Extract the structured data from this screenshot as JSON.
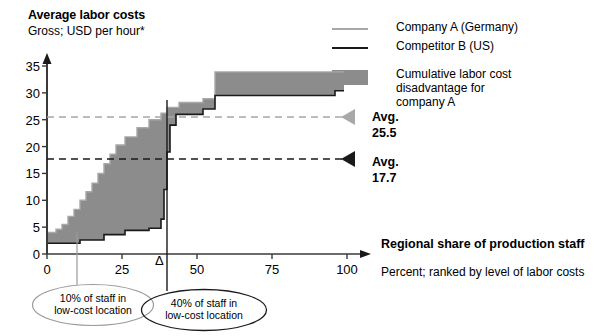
{
  "chart_data": {
    "type": "area",
    "title": "Average labor costs",
    "subtitle": "Gross; USD per hour*",
    "xlabel": "Regional share of production staff",
    "xsublabel": "Percent; ranked by level of labor costs",
    "ylabel": "",
    "xlim": [
      0,
      100
    ],
    "ylim": [
      0,
      35
    ],
    "xticks": [
      0,
      25,
      50,
      75,
      100
    ],
    "yticks": [
      0,
      5,
      10,
      15,
      20,
      25,
      30,
      35
    ],
    "grid": false,
    "legend_position": "top-right",
    "series": [
      {
        "name": "Company A (Germany)",
        "color": "#a8a8a8",
        "style": "step",
        "points": [
          [
            0,
            4.0
          ],
          [
            3,
            4.0
          ],
          [
            3,
            4.6
          ],
          [
            5,
            4.6
          ],
          [
            5,
            5.5
          ],
          [
            7,
            5.5
          ],
          [
            7,
            7.0
          ],
          [
            9,
            7.0
          ],
          [
            9,
            8.3
          ],
          [
            11,
            8.3
          ],
          [
            11,
            10.0
          ],
          [
            13,
            10.0
          ],
          [
            13,
            11.6
          ],
          [
            15,
            11.6
          ],
          [
            15,
            13.2
          ],
          [
            17,
            13.2
          ],
          [
            17,
            15.0
          ],
          [
            19,
            15.0
          ],
          [
            19,
            16.8
          ],
          [
            21,
            16.8
          ],
          [
            21,
            18.6
          ],
          [
            23,
            18.6
          ],
          [
            23,
            20.3
          ],
          [
            26,
            20.3
          ],
          [
            26,
            21.8
          ],
          [
            30,
            21.8
          ],
          [
            30,
            23.5
          ],
          [
            34,
            23.5
          ],
          [
            34,
            25.0
          ],
          [
            38,
            25.0
          ],
          [
            38,
            26.2
          ],
          [
            40,
            26.2
          ],
          [
            40,
            27.3
          ],
          [
            44,
            27.3
          ],
          [
            44,
            28.2
          ],
          [
            52,
            28.2
          ],
          [
            52,
            28.9
          ],
          [
            56,
            28.9
          ],
          [
            56,
            33.9
          ],
          [
            99,
            33.9
          ]
        ]
      },
      {
        "name": "Competitor B (US)",
        "color": "#1a1a1a",
        "style": "step",
        "points": [
          [
            0,
            2.0
          ],
          [
            11,
            2.0
          ],
          [
            11,
            2.6
          ],
          [
            19,
            2.6
          ],
          [
            19,
            3.6
          ],
          [
            26,
            3.6
          ],
          [
            26,
            4.4
          ],
          [
            34,
            4.4
          ],
          [
            34,
            4.8
          ],
          [
            38,
            4.8
          ],
          [
            38,
            6.5
          ],
          [
            39,
            6.5
          ],
          [
            39,
            12.0
          ],
          [
            40,
            12.0
          ],
          [
            40,
            19.0
          ],
          [
            41,
            19.0
          ],
          [
            41,
            24.0
          ],
          [
            43,
            24.0
          ],
          [
            43,
            26.0
          ],
          [
            52,
            26.0
          ],
          [
            52,
            27.0
          ],
          [
            56,
            27.0
          ],
          [
            56,
            29.5
          ],
          [
            96,
            29.5
          ],
          [
            96,
            30.4
          ],
          [
            99,
            30.4
          ]
        ]
      }
    ],
    "band": {
      "name": "Cumulative labor cost disadvantage for company A",
      "color": "#8c8c8c"
    },
    "annotations": [
      {
        "name": "avg-company-a",
        "label": "Avg.",
        "value": "25.5",
        "y": 25.5,
        "color": "#a8a8a8",
        "style": "dashed-line-with-left-triangle"
      },
      {
        "name": "avg-competitor-b",
        "label": "Avg.",
        "value": "17.7",
        "y": 17.7,
        "color": "#1a1a1a",
        "style": "dashed-line-with-left-triangle"
      },
      {
        "name": "delta-marker",
        "label": "Δ",
        "x": 40
      }
    ],
    "callouts": [
      {
        "name": "callout-10-percent",
        "line1": "10% of staff in",
        "line2": "low-cost location",
        "anchor_x": 10,
        "color": "#9a9a9a"
      },
      {
        "name": "callout-40-percent",
        "line1": "40% of staff in",
        "line2": "low-cost location",
        "anchor_x": 40,
        "color": "#1a1a1a"
      }
    ]
  },
  "legend": {
    "items": [
      {
        "label": "Company A (Germany)",
        "type": "line",
        "color": "#a8a8a8"
      },
      {
        "label": "Competitor B (US)",
        "type": "line",
        "color": "#1a1a1a"
      },
      {
        "label": "Cumulative labor cost",
        "label2": "disadvantage for",
        "label3": "company A",
        "type": "box",
        "color": "#8c8c8c"
      }
    ]
  },
  "yticks_text": [
    "0",
    "5",
    "10",
    "15",
    "20",
    "25",
    "30",
    "35"
  ],
  "xticks_text": [
    "0",
    "25",
    "50",
    "75",
    "100"
  ]
}
